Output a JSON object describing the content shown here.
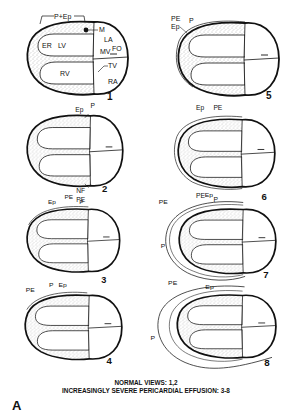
{
  "figure": {
    "caption_line1": "NORMAL VIEWS: 1,2",
    "caption_line2": "INCREASINGLY SEVERE PERICARDIAL EFFUSION: 3-8",
    "panel_letter": "A"
  },
  "panels": [
    {
      "number": "1",
      "labels": {
        "p_ep": "P+Ep",
        "m": "M",
        "er": "ER",
        "lv": "LV",
        "la": "LA",
        "mv": "MV",
        "fo": "FO",
        "rv": "RV",
        "tv": "TV",
        "ra": "RA"
      }
    },
    {
      "number": "2",
      "labels": {
        "ep": "Ep",
        "p": "P",
        "nf": "NF",
        "pe": "PE"
      }
    },
    {
      "number": "3",
      "labels": {
        "pe": "PE",
        "ep": "Ep",
        "p": "P"
      }
    },
    {
      "number": "4",
      "labels": {
        "pe": "PE",
        "p": "P",
        "ep": "Ep"
      }
    },
    {
      "number": "5",
      "labels": {
        "pe": "PE",
        "ep": "Ep",
        "p": "P"
      }
    },
    {
      "number": "6",
      "labels": {
        "ep": "Ep",
        "pe_top": "PE",
        "pe_bottom": "PE",
        "p": "P"
      }
    },
    {
      "number": "7",
      "labels": {
        "ep": "Ep",
        "pe": "PE",
        "p": "P"
      }
    },
    {
      "number": "8",
      "labels": {
        "pe": "PE",
        "ep": "Ep",
        "p": "P"
      }
    }
  ],
  "colors": {
    "ink": "#111111",
    "background": "#ffffff",
    "stipple": "#9a9a9a"
  }
}
